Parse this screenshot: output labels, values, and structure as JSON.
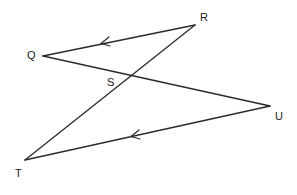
{
  "diagram": {
    "type": "geometry-figure",
    "points": {
      "Q": {
        "label": "Q",
        "x": 43,
        "y": 56,
        "label_x": 27,
        "label_y": 59
      },
      "R": {
        "label": "R",
        "x": 195,
        "y": 25,
        "label_x": 200,
        "label_y": 21
      },
      "S": {
        "label": "S",
        "x": 129,
        "y": 77,
        "label_x": 107,
        "label_y": 86
      },
      "T": {
        "label": "T",
        "x": 25,
        "y": 160,
        "label_x": 15,
        "label_y": 177
      },
      "U": {
        "label": "U",
        "x": 270,
        "y": 106,
        "label_x": 275,
        "label_y": 120
      }
    },
    "segments": [
      {
        "from": "R",
        "to": "Q",
        "parallel_mark": true
      },
      {
        "from": "Q",
        "to": "U",
        "parallel_mark": false
      },
      {
        "from": "R",
        "to": "T",
        "parallel_mark": false
      },
      {
        "from": "U",
        "to": "T",
        "parallel_mark": true
      }
    ],
    "parallel_marks": [
      {
        "segment": "RQ",
        "x": 102,
        "y": 43,
        "direction": "toward-Q"
      },
      {
        "segment": "UT",
        "x": 133,
        "y": 136,
        "direction": "toward-T"
      }
    ],
    "colors": {
      "line": "#2a2a2a",
      "background": "#ffffff",
      "label": "#222222"
    }
  }
}
